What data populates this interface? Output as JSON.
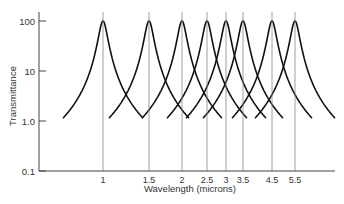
{
  "chart_data": {
    "type": "line",
    "title": "",
    "xlabel": "Wavelength (microns)",
    "ylabel": "Transmittance",
    "yscale": "log",
    "ylim": [
      0.1,
      100
    ],
    "yticks": [
      "100",
      "10",
      "1.0",
      "0.1"
    ],
    "xtick_labels": [
      "1",
      "1.5",
      "2",
      "2.5",
      "3",
      "3.5",
      "4.5",
      "5.5"
    ],
    "grid": false,
    "legend": null,
    "series": [
      {
        "name": "filter 1",
        "center": 1,
        "peak": 100
      },
      {
        "name": "filter 1.5",
        "center": 1.5,
        "peak": 100
      },
      {
        "name": "filter 2",
        "center": 2,
        "peak": 100
      },
      {
        "name": "filter 2.5",
        "center": 2.5,
        "peak": 100
      },
      {
        "name": "filter 3",
        "center": 3,
        "peak": 100
      },
      {
        "name": "filter 3.5",
        "center": 3.5,
        "peak": 100
      },
      {
        "name": "filter 4.5",
        "center": 4.5,
        "peak": 100
      },
      {
        "name": "filter 5.5",
        "center": 5.5,
        "peak": 100
      }
    ]
  },
  "layout": {
    "tick_x_px": [
      103,
      149,
      182,
      207,
      226,
      243,
      272,
      295
    ],
    "ytick_y_px": [
      21,
      71,
      121,
      171
    ],
    "axis_x_px": 39,
    "axis_bottom_px": 171,
    "axis_right_px": 335,
    "half_width_px": 22
  }
}
